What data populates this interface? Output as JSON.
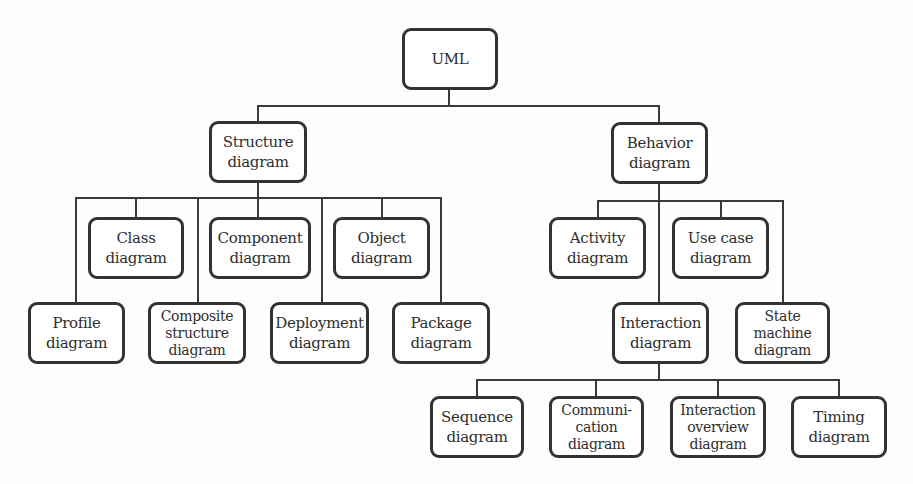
{
  "diagram": {
    "root": {
      "lines": [
        "UML"
      ]
    },
    "structure": {
      "node": {
        "lines": [
          "Structure",
          "diagram"
        ]
      },
      "children": [
        {
          "id": "class",
          "lines": [
            "Class",
            "diagram"
          ]
        },
        {
          "id": "component",
          "lines": [
            "Component",
            "diagram"
          ]
        },
        {
          "id": "object",
          "lines": [
            "Object",
            "diagram"
          ]
        },
        {
          "id": "profile",
          "lines": [
            "Profile",
            "diagram"
          ]
        },
        {
          "id": "composite-structure",
          "lines": [
            "Composite",
            "structure",
            "diagram"
          ]
        },
        {
          "id": "deployment",
          "lines": [
            "Deployment",
            "diagram"
          ]
        },
        {
          "id": "package",
          "lines": [
            "Package",
            "diagram"
          ]
        }
      ]
    },
    "behavior": {
      "node": {
        "lines": [
          "Behavior",
          "diagram"
        ]
      },
      "children": [
        {
          "id": "activity",
          "lines": [
            "Activity",
            "diagram"
          ]
        },
        {
          "id": "use-case",
          "lines": [
            "Use case",
            "diagram"
          ]
        },
        {
          "id": "interaction",
          "lines": [
            "Interaction",
            "diagram"
          ]
        },
        {
          "id": "state-machine",
          "lines": [
            "State",
            "machine",
            "diagram"
          ]
        }
      ]
    },
    "interaction": {
      "children": [
        {
          "id": "sequence",
          "lines": [
            "Sequence",
            "diagram"
          ]
        },
        {
          "id": "communication",
          "lines": [
            "Communi-",
            "cation",
            "diagram"
          ]
        },
        {
          "id": "interaction-overview",
          "lines": [
            "Interaction",
            "overview",
            "diagram"
          ]
        },
        {
          "id": "timing",
          "lines": [
            "Timing",
            "diagram"
          ]
        }
      ]
    },
    "colors": {
      "stroke": "#333333",
      "text": "#2e2e2e",
      "background": "#fdfdfd"
    }
  }
}
